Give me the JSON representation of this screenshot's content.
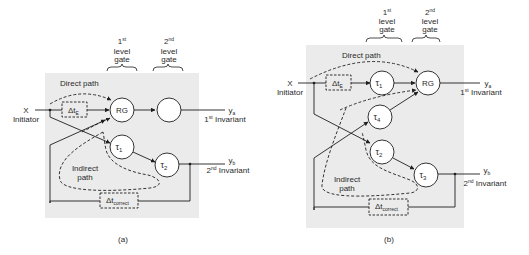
{
  "colors": {
    "panel_bg": "#ebebeb",
    "stroke": "#1e1e1e",
    "text": "#2a2a2a"
  },
  "panel_a": {
    "caption": "(a)",
    "gate1": {
      "num": "1",
      "sup": "st",
      "line1": "level",
      "line2": "gate"
    },
    "gate2": {
      "num": "2",
      "sup": "nd",
      "line1": "level",
      "line2": "gate"
    },
    "input": {
      "var": "X",
      "label": "Initiator"
    },
    "direct_path": "Direct path",
    "indirect_path": {
      "line1": "Indirect",
      "line2": "path"
    },
    "delay_e": {
      "sym": "Δt",
      "sub": "E"
    },
    "delay_correct": {
      "sym": "Δt",
      "sub": "correct"
    },
    "nodes": {
      "rg": "RG",
      "second_gate": "",
      "tau1": {
        "sym": "τ",
        "sub": "1"
      },
      "tau2": {
        "sym": "τ",
        "sub": "2"
      }
    },
    "output_a": {
      "var": "y",
      "sub": "a",
      "num": "1",
      "sup": "st",
      "label": "Invariant"
    },
    "output_b": {
      "var": "y",
      "sub": "b",
      "num": "2",
      "sup": "nd",
      "label": "Invariant"
    }
  },
  "panel_b": {
    "caption": "(b)",
    "gate1": {
      "num": "1",
      "sup": "st",
      "line1": "level",
      "line2": "gate"
    },
    "gate2": {
      "num": "2",
      "sup": "nd",
      "line1": "level",
      "line2": "gate"
    },
    "input": {
      "var": "X",
      "label": "Initiator"
    },
    "direct_path": "Direct path",
    "indirect_path": {
      "line1": "Indirect",
      "line2": "path"
    },
    "delay_e": {
      "sym": "Δt",
      "sub": "E"
    },
    "delay_correct": {
      "sym": "Δt",
      "sub": "correct"
    },
    "nodes": {
      "rg": "RG",
      "tau1": {
        "sym": "τ",
        "sub": "1"
      },
      "tau2": {
        "sym": "τ",
        "sub": "2"
      },
      "tau3": {
        "sym": "τ",
        "sub": "3"
      },
      "tau4": {
        "sym": "τ",
        "sub": "4"
      }
    },
    "output_a": {
      "var": "y",
      "sub": "a",
      "num": "1",
      "sup": "st",
      "label": "Invariant"
    },
    "output_b": {
      "var": "y",
      "sub": "b",
      "num": "2",
      "sup": "nd",
      "label": "Invariant"
    }
  }
}
